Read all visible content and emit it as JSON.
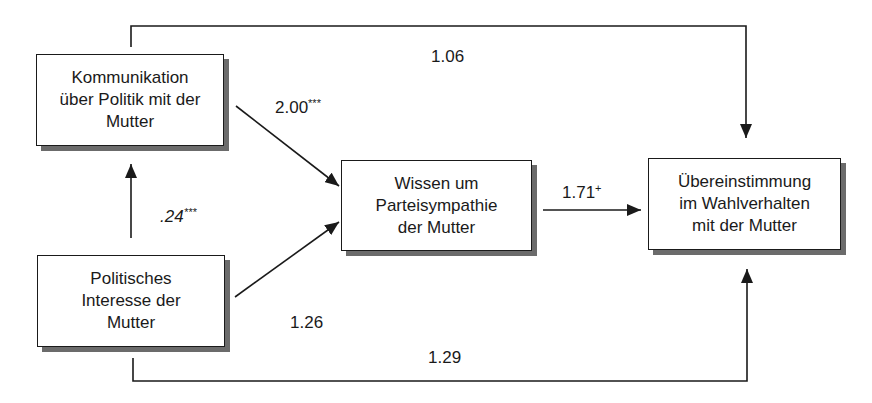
{
  "diagram": {
    "type": "path-diagram",
    "nodes": {
      "kommunikation": {
        "label": "Kommunikation\nüber Politik mit der\nMutter"
      },
      "interesse": {
        "label": "Politisches\nInteresse der\nMutter"
      },
      "wissen": {
        "label": "Wissen um\nParteisympathie\nder Mutter"
      },
      "uebereinstimmung": {
        "label": "Übereinstimmung\nim Wahlverhalten\nmit der Mutter"
      }
    },
    "edges": [
      {
        "from": "interesse",
        "to": "kommunikation",
        "coef": ".24",
        "sig": "***"
      },
      {
        "from": "kommunikation",
        "to": "wissen",
        "coef": "2.00",
        "sig": "***"
      },
      {
        "from": "interesse",
        "to": "wissen",
        "coef": "1.26",
        "sig": ""
      },
      {
        "from": "wissen",
        "to": "uebereinstimmung",
        "coef": "1.71",
        "sig": "+"
      },
      {
        "from": "kommunikation",
        "to": "uebereinstimmung",
        "coef": "1.06",
        "sig": ""
      },
      {
        "from": "interesse",
        "to": "uebereinstimmung",
        "coef": "1.29",
        "sig": ""
      }
    ]
  }
}
